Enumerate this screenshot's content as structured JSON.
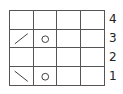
{
  "chart": {
    "title": "",
    "columns": 4,
    "rows": [
      {
        "number": "4",
        "cells": [
          "",
          "",
          "",
          ""
        ]
      },
      {
        "number": "3",
        "cells": [
          "k2tog",
          "yo",
          "",
          ""
        ]
      },
      {
        "number": "2",
        "cells": [
          "",
          "",
          "",
          ""
        ]
      },
      {
        "number": "1",
        "cells": [
          "ssk",
          "yo",
          "",
          ""
        ]
      }
    ],
    "symbols": {
      "k2tog": "/",
      "ssk": "\\",
      "yo": "O"
    }
  }
}
